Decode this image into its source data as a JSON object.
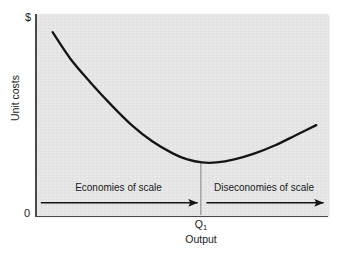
{
  "chart_data": {
    "type": "line",
    "title": "",
    "xlabel": "Output",
    "ylabel": "Unit costs",
    "y_axis_top_label": "$",
    "y_axis_origin_label": "0",
    "grid": false,
    "legend": "none",
    "xlim": [
      0,
      1
    ],
    "ylim": [
      0,
      1
    ],
    "series": [
      {
        "name": "Long-run average cost curve",
        "shape": "u-shaped",
        "x": [
          0.06,
          0.12,
          0.19,
          0.26,
          0.33,
          0.4,
          0.47,
          0.52,
          0.57,
          0.62,
          0.68,
          0.75,
          0.82,
          0.89,
          0.96
        ],
        "y": [
          0.91,
          0.78,
          0.66,
          0.55,
          0.45,
          0.37,
          0.31,
          0.28,
          0.265,
          0.265,
          0.28,
          0.31,
          0.35,
          0.4,
          0.45
        ]
      }
    ],
    "annotations": [
      {
        "name": "economies-of-scale",
        "label": "Economies of scale",
        "arrow_from_x": 0.02,
        "arrow_to_x": 0.555,
        "arrow_y": 0.065
      },
      {
        "name": "diseconomies-of-scale",
        "label": "Diseconomies of scale",
        "arrow_from_x": 0.585,
        "arrow_to_x": 0.985,
        "arrow_y": 0.065
      }
    ],
    "markers": [
      {
        "name": "minimum-efficient-scale",
        "label": "Q",
        "label_subscript": "1",
        "x": 0.566,
        "type": "vertical-drop-line"
      }
    ]
  },
  "style": {
    "panel_color": "#e2e2e2",
    "page_background": "#ffffff",
    "curve_color": "#151515",
    "axis_color": "#4a4a4a",
    "text_color": "#1a1a1a",
    "divider_color": "#9a9a9a"
  }
}
